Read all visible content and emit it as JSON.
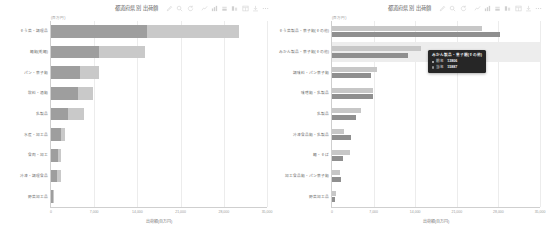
{
  "colors": {
    "series_light": "#c9c9c9",
    "series_dark": "#9e9e9e",
    "grouped_light": "#c7c7c7",
    "grouped_dark": "#8f8f8f",
    "highlight_row": "#ededed",
    "tooltip_bg": "#262626",
    "axis_line": "#cfcfcf",
    "grid_line": "#ececec",
    "page_bg": "#ffffff"
  },
  "toolbox": {
    "icons": [
      {
        "name": "brush-icon",
        "glyph": "brush"
      },
      {
        "name": "data-zoom-icon",
        "glyph": "zoom"
      },
      {
        "name": "restore-icon",
        "glyph": "restore"
      },
      {
        "name": "magic-type-line-icon",
        "glyph": "line"
      },
      {
        "name": "magic-type-bar-icon",
        "glyph": "bar"
      },
      {
        "name": "magic-type-stack-icon",
        "glyph": "stack"
      },
      {
        "name": "magic-type-tiled-icon",
        "glyph": "tiled"
      },
      {
        "name": "data-view-icon",
        "glyph": "dataview"
      },
      {
        "name": "save-image-icon",
        "glyph": "save"
      },
      {
        "name": "more-icon",
        "glyph": "more"
      }
    ]
  },
  "left_panel": {
    "title": "都道府県別 出荷額",
    "axis_unit_label": "(百万円)",
    "xaxis_title": "出荷額(百万円)",
    "tooltip": null
  },
  "right_panel": {
    "title": "都道府県別 出荷額",
    "axis_unit_label": "(百万円)",
    "xaxis_title": "出荷額(百万円)",
    "tooltip": {
      "title": "みかん製品・菓子類(その他)",
      "rows": [
        {
          "name": "前年",
          "value": "13806",
          "color": "#c7c7c7"
        },
        {
          "name": "当年",
          "value": "15887",
          "color": "#8f8f8f"
        }
      ]
    }
  },
  "chart_data": [
    {
      "id": "left-chart",
      "type": "bar",
      "orientation": "horizontal",
      "stacked": true,
      "title": "都道府県別 出荷額",
      "xlabel": "出荷額(百万円)",
      "ylabel": "",
      "xlim": [
        0,
        35000
      ],
      "xticks": [
        0,
        7000,
        14000,
        21000,
        28000,
        35000
      ],
      "xtick_labels": [
        "0",
        "7,000",
        "14,000",
        "21,000",
        "28,000",
        "35,000"
      ],
      "grid": true,
      "legend_position": "hidden",
      "categories": [
        "そう菜・調理品",
        "麺類(乾麺)",
        "パン・菓子類",
        "飲料・酒類",
        "乳製品",
        "水産・加工品",
        "食肉・加工",
        "冷凍・調理食品",
        "野菜加工品"
      ],
      "series": [
        {
          "name": "前年",
          "color": "#9e9e9e",
          "values": [
            15600,
            7800,
            4650,
            4400,
            2700,
            1700,
            1100,
            900,
            260
          ]
        },
        {
          "name": "当年",
          "color": "#c9c9c9",
          "values": [
            14900,
            7500,
            3200,
            2400,
            2600,
            600,
            450,
            700,
            60
          ]
        }
      ],
      "totals": [
        30500,
        15300,
        7850,
        6800,
        5300,
        2300,
        1550,
        1600,
        320
      ]
    },
    {
      "id": "right-chart",
      "type": "bar",
      "orientation": "horizontal",
      "stacked": false,
      "grouped": true,
      "title": "都道府県別 出荷額",
      "xlabel": "出荷額(百万円)",
      "ylabel": "",
      "xlim": [
        0,
        35000
      ],
      "xticks": [
        0,
        7000,
        14000,
        21000,
        28000,
        35000
      ],
      "xtick_labels": [
        "0",
        "7,000",
        "14,000",
        "21,000",
        "28,000",
        "35,000"
      ],
      "grid": true,
      "legend_position": "hidden",
      "highlighted_category": "みかん製品・菓子類(その他)",
      "categories": [
        "そう菜製品・菓子類(その他)",
        "みかん製品・菓子類(その他)",
        "調味料・パン菓子類",
        "味噌類・乳製品",
        "乳製品",
        "冷凍食品類・乳製品",
        "麺・そば",
        "加工食品類・パン菓子類",
        "野菜加工品"
      ],
      "series": [
        {
          "name": "前年",
          "color": "#c7c7c7",
          "values": [
            25200,
            14900,
            7500,
            6900,
            4900,
            2000,
            3100,
            1300,
            700
          ]
        },
        {
          "name": "当年",
          "color": "#8f8f8f",
          "values": [
            28300,
            12800,
            6600,
            6950,
            4050,
            3200,
            1900,
            1550,
            560
          ]
        }
      ]
    }
  ]
}
